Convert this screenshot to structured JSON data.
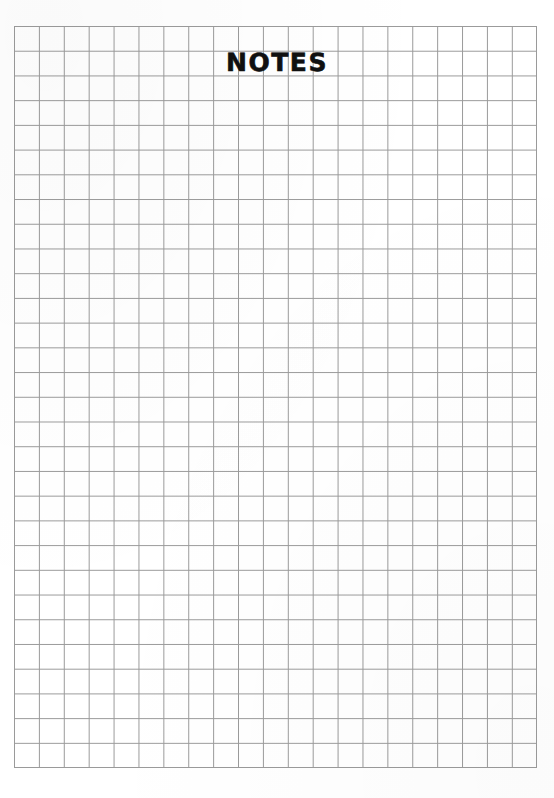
{
  "page": {
    "width": 554,
    "height": 798,
    "background_color": "#ffffff",
    "kind": "scanned-notepaper"
  },
  "header": {
    "running_head": "",
    "page_number": "",
    "visible": true,
    "legible": false,
    "note": "clipped at top edge of scan, text not readable"
  },
  "title": {
    "text": "NOTES",
    "color": "#101010"
  },
  "grid": {
    "columns": 21,
    "rows": 30,
    "cell_width_px": 24.9,
    "cell_height_px": 24.73,
    "left_px": 14,
    "top_px": 26,
    "width_px": 523,
    "height_px": 742,
    "line_color": "#9a9a9a",
    "line_width_px": 1,
    "paper_color": "#ffffff"
  },
  "content": {
    "writing": "",
    "note": "grid area is blank"
  }
}
